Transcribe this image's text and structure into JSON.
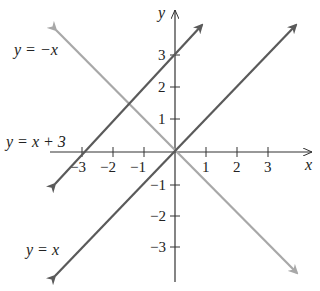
{
  "diagram": {
    "axes": {
      "x_label": "x",
      "y_label": "y",
      "x_ticks": [
        "−3",
        "−2",
        "−1",
        "1",
        "2",
        "3"
      ],
      "y_ticks": [
        "3",
        "2",
        "1",
        "−1",
        "−2",
        "−3"
      ]
    },
    "lines": [
      {
        "equation": "y = x + 3",
        "color": "#5a5a5a"
      },
      {
        "equation": "y = x",
        "color": "#5a5a5a"
      },
      {
        "equation": "y = −x",
        "color": "#a8a8a8"
      }
    ]
  }
}
